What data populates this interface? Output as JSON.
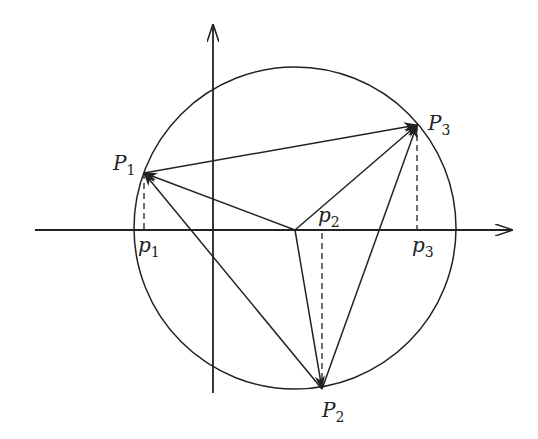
{
  "diagram": {
    "type": "geometry",
    "colors": {
      "stroke": "#222222",
      "background": "#ffffff"
    },
    "axes": {
      "x": {
        "from": [
          35,
          230
        ],
        "to": [
          512,
          230
        ]
      },
      "y": {
        "from": [
          213,
          393
        ],
        "to": [
          213,
          25
        ]
      }
    },
    "circle": {
      "cx": 295,
      "cy": 228,
      "r": 161
    },
    "center": {
      "x": 295,
      "y": 230
    },
    "points": [
      {
        "id": "P1",
        "label": "P",
        "sub": "1",
        "x": 144,
        "y": 173,
        "label_x": 113,
        "label_y": 170
      },
      {
        "id": "P2",
        "label": "P",
        "sub": "2",
        "x": 322,
        "y": 389,
        "label_x": 322,
        "label_y": 417
      },
      {
        "id": "P3",
        "label": "P",
        "sub": "3",
        "x": 417,
        "y": 125,
        "label_x": 428,
        "label_y": 130
      }
    ],
    "projections": [
      {
        "id": "p1",
        "label": "p",
        "sub": "1",
        "x": 144,
        "label_x": 138,
        "label_y": 252
      },
      {
        "id": "p2",
        "label": "p",
        "sub": "2",
        "x": 322,
        "label_x": 318,
        "label_y": 222
      },
      {
        "id": "p3",
        "label": "p",
        "sub": "3",
        "x": 417,
        "label_x": 412,
        "label_y": 252
      }
    ],
    "edges": [
      {
        "from": "P1",
        "to": "P3",
        "arrow": true
      },
      {
        "from": "P2",
        "to": "P3",
        "arrow": true
      },
      {
        "from": "P2",
        "to": "P1",
        "arrow": true
      },
      {
        "from": "center",
        "to": "P1",
        "arrow": true
      },
      {
        "from": "center",
        "to": "P3",
        "arrow": true
      },
      {
        "from": "center",
        "to": "P2",
        "arrow": true
      }
    ]
  }
}
